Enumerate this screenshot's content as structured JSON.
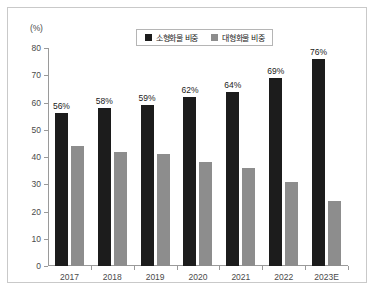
{
  "chart_data": {
    "type": "bar",
    "title": "",
    "xlabel": "",
    "ylabel": "(%)",
    "unit_label": "(%)",
    "ylim": [
      0,
      80
    ],
    "ytick_step": 10,
    "yticks": [
      0,
      10,
      20,
      30,
      40,
      50,
      60,
      70,
      80
    ],
    "grid": false,
    "legend_position": "top-center",
    "categories": [
      "2017",
      "2018",
      "2019",
      "2020",
      "2021",
      "2022",
      "2023E"
    ],
    "series": [
      {
        "name": "소형화물 비중",
        "color": "#1c1c1c",
        "values": [
          56,
          58,
          59,
          62,
          64,
          69,
          76
        ],
        "labels": [
          "56%",
          "58%",
          "59%",
          "62%",
          "64%",
          "69%",
          "76%"
        ],
        "show_labels": true
      },
      {
        "name": "대형화물 비중",
        "color": "#8d8d8d",
        "values": [
          44,
          42,
          41,
          38,
          36,
          31,
          24
        ],
        "labels": [
          "",
          "",
          "",
          "",
          "",
          "",
          ""
        ],
        "show_labels": false
      }
    ]
  }
}
